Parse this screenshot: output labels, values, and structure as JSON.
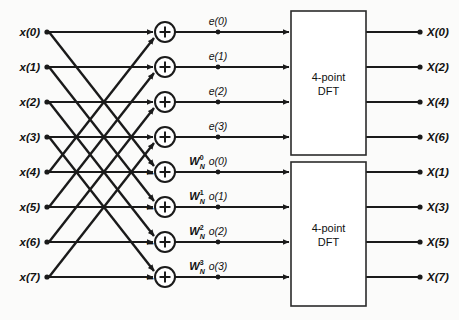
{
  "diagram": {
    "type": "signal-flow-graph",
    "colors": {
      "line": "#1a1a1a",
      "box_stroke": "#2b2b2b",
      "background": "#fbfbfa",
      "text": "#111111"
    },
    "inputs": [
      {
        "label": "x(0)",
        "y": 32
      },
      {
        "label": "x(1)",
        "y": 67
      },
      {
        "label": "x(2)",
        "y": 102
      },
      {
        "label": "x(3)",
        "y": 137
      },
      {
        "label": "x(4)",
        "y": 172
      },
      {
        "label": "x(5)",
        "y": 207
      },
      {
        "label": "x(6)",
        "y": 242
      },
      {
        "label": "x(7)",
        "y": 277
      }
    ],
    "adders": [
      {
        "sign": "+",
        "extra_sign": "",
        "y": 32
      },
      {
        "sign": "+",
        "extra_sign": "",
        "y": 67
      },
      {
        "sign": "+",
        "extra_sign": "",
        "y": 102
      },
      {
        "sign": "+",
        "extra_sign": "",
        "y": 137
      },
      {
        "sign": "+",
        "extra_sign": "−",
        "y": 172
      },
      {
        "sign": "+",
        "extra_sign": "−",
        "y": 207
      },
      {
        "sign": "+",
        "extra_sign": "−",
        "y": 242
      },
      {
        "sign": "+",
        "extra_sign": "−",
        "y": 277
      }
    ],
    "intermediate_labels": [
      {
        "label": "e(0)",
        "y": 32
      },
      {
        "label": "e(1)",
        "y": 67
      },
      {
        "label": "e(2)",
        "y": 102
      },
      {
        "label": "e(3)",
        "y": 137
      },
      {
        "label": "o(0)",
        "y": 172
      },
      {
        "label": "o(1)",
        "y": 207
      },
      {
        "label": "o(2)",
        "y": 242
      },
      {
        "label": "o(3)",
        "y": 277
      }
    ],
    "twiddle_factors": [
      {
        "base": "W",
        "sub": "N",
        "sup": "0",
        "y": 172
      },
      {
        "base": "W",
        "sub": "N",
        "sup": "1",
        "y": 207
      },
      {
        "base": "W",
        "sub": "N",
        "sup": "2",
        "y": 242
      },
      {
        "base": "W",
        "sub": "N",
        "sup": "3",
        "y": 277
      }
    ],
    "blocks": [
      {
        "line1": "4-point",
        "line2": "DFT",
        "top": 11,
        "bottom": 155
      },
      {
        "line1": "4-point",
        "line2": "DFT",
        "top": 162,
        "bottom": 306
      }
    ],
    "outputs": [
      {
        "label": "X(0)",
        "y": 32
      },
      {
        "label": "X(2)",
        "y": 67
      },
      {
        "label": "X(4)",
        "y": 102
      },
      {
        "label": "X(6)",
        "y": 137
      },
      {
        "label": "X(1)",
        "y": 172
      },
      {
        "label": "X(3)",
        "y": 207
      },
      {
        "label": "X(5)",
        "y": 242
      },
      {
        "label": "X(7)",
        "y": 277
      }
    ]
  }
}
